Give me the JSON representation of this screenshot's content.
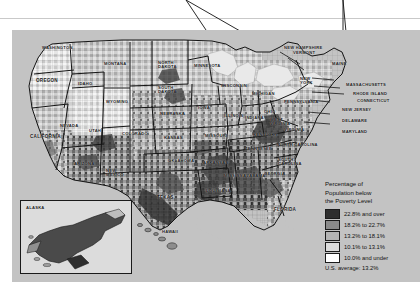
{
  "map": {
    "title": "",
    "ocean_color": "#c3c3c3",
    "lake_color": "#e8e8e8",
    "border_color": "#141414",
    "county_line_color": "#6b6b6b"
  },
  "legend": {
    "title_line_1": "Percentage of",
    "title_line_2": "Population below",
    "title_line_3": "the Poverty Level",
    "classes": [
      {
        "label": "22.8% and over",
        "color": "#2e2e2e"
      },
      {
        "label": "18.2% to 22.7%",
        "color": "#8a8a8a"
      },
      {
        "label": "13.2% to 18.1%",
        "color": "#b4b4b4"
      },
      {
        "label": "10.1% to 13.1%",
        "color": "#dcdcdc"
      },
      {
        "label": "10.0% and under",
        "color": "#ffffff"
      }
    ],
    "average_label": "U.S. average:  13.2%"
  },
  "insets": {
    "alaska_label": "ALASKA",
    "hawaii_label": "HAWAII"
  },
  "states": [
    {
      "name": "WASHINGTON",
      "x": 30,
      "y": 16,
      "cls": ""
    },
    {
      "name": "OREGON",
      "x": 24,
      "y": 48,
      "cls": "big"
    },
    {
      "name": "CALIFORNIA",
      "x": 18,
      "y": 104,
      "cls": "big"
    },
    {
      "name": "NEVADA",
      "x": 48,
      "y": 94,
      "cls": ""
    },
    {
      "name": "IDAHO",
      "x": 66,
      "y": 52,
      "cls": ""
    },
    {
      "name": "MONTANA",
      "x": 92,
      "y": 32,
      "cls": ""
    },
    {
      "name": "WYOMING",
      "x": 94,
      "y": 70,
      "cls": ""
    },
    {
      "name": "UTAH",
      "x": 77,
      "y": 99,
      "cls": ""
    },
    {
      "name": "ARIZONA",
      "x": 62,
      "y": 132,
      "cls": ""
    },
    {
      "name": "COLORADO",
      "x": 110,
      "y": 102,
      "cls": ""
    },
    {
      "name": "NEW\nMEXICO",
      "x": 94,
      "y": 139,
      "cls": "two"
    },
    {
      "name": "NORTH\nDAKOTA",
      "x": 146,
      "y": 31,
      "cls": "two"
    },
    {
      "name": "SOUTH\nDAKOTA",
      "x": 146,
      "y": 56,
      "cls": "two"
    },
    {
      "name": "NEBRASKA",
      "x": 148,
      "y": 82,
      "cls": ""
    },
    {
      "name": "KANSAS",
      "x": 152,
      "y": 106,
      "cls": ""
    },
    {
      "name": "OKLAHOMA",
      "x": 156,
      "y": 129,
      "cls": ""
    },
    {
      "name": "TEXAS",
      "x": 145,
      "y": 165,
      "cls": "big"
    },
    {
      "name": "MINNESOTA",
      "x": 182,
      "y": 34,
      "cls": ""
    },
    {
      "name": "IOWA",
      "x": 186,
      "y": 76,
      "cls": ""
    },
    {
      "name": "MISSOURI",
      "x": 193,
      "y": 104,
      "cls": ""
    },
    {
      "name": "ARKANSAS",
      "x": 191,
      "y": 131,
      "cls": ""
    },
    {
      "name": "LOUISIANA",
      "x": 194,
      "y": 159,
      "cls": ""
    },
    {
      "name": "WISCONSIN",
      "x": 209,
      "y": 54,
      "cls": ""
    },
    {
      "name": "ILLINOIS",
      "x": 212,
      "y": 84,
      "cls": ""
    },
    {
      "name": "MICHIGAN",
      "x": 240,
      "y": 62,
      "cls": ""
    },
    {
      "name": "INDIANA",
      "x": 233,
      "y": 86,
      "cls": ""
    },
    {
      "name": "OHIO",
      "x": 252,
      "y": 80,
      "cls": ""
    },
    {
      "name": "KENTUCKY",
      "x": 241,
      "y": 103,
      "cls": ""
    },
    {
      "name": "TENNESSEE",
      "x": 233,
      "y": 117,
      "cls": ""
    },
    {
      "name": "MISSISSIPPI",
      "x": 212,
      "y": 144,
      "cls": ""
    },
    {
      "name": "ALABAMA",
      "x": 231,
      "y": 144,
      "cls": ""
    },
    {
      "name": "GEORGIA",
      "x": 252,
      "y": 142,
      "cls": ""
    },
    {
      "name": "FLORIDA",
      "x": 262,
      "y": 177,
      "cls": "big"
    },
    {
      "name": "SOUTH\nCAROLINA",
      "x": 266,
      "y": 128,
      "cls": "two"
    },
    {
      "name": "NORTH CAROLINA",
      "x": 265,
      "y": 113,
      "cls": ""
    },
    {
      "name": "VIRGINIA",
      "x": 272,
      "y": 98,
      "cls": ""
    },
    {
      "name": "WEST\nVIRGINIA",
      "x": 258,
      "y": 88,
      "cls": "two"
    },
    {
      "name": "PENNSYLVANIA",
      "x": 272,
      "y": 70,
      "cls": ""
    },
    {
      "name": "NEW\nYORK",
      "x": 288,
      "y": 47,
      "cls": "two"
    },
    {
      "name": "MAINE",
      "x": 320,
      "y": 32,
      "cls": ""
    }
  ],
  "callout_labels": [
    {
      "name": "NEW HAMPSHIRE",
      "x": 272,
      "y": 16
    },
    {
      "name": "VERMONT",
      "x": 281,
      "y": 21
    },
    {
      "name": "MASSACHUSETTS",
      "x": 334,
      "y": 53
    },
    {
      "name": "RHODE ISLAND",
      "x": 341,
      "y": 62
    },
    {
      "name": "CONNECTICUT",
      "x": 345,
      "y": 69
    },
    {
      "name": "NEW JERSEY",
      "x": 330,
      "y": 78
    },
    {
      "name": "DELAWARE",
      "x": 330,
      "y": 89
    },
    {
      "name": "MARYLAND",
      "x": 330,
      "y": 100
    }
  ]
}
